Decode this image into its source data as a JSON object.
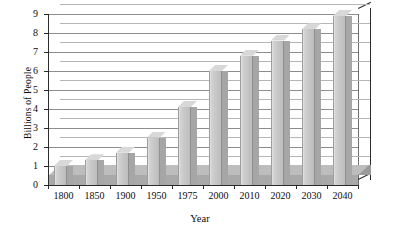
{
  "chart_data": {
    "type": "bar",
    "title": "",
    "subtitle": "",
    "xlabel": "Year",
    "ylabel": "Billions of People",
    "categories": [
      "1800",
      "1850",
      "1900",
      "1950",
      "1975",
      "2000",
      "2010",
      "2020",
      "2030",
      "2040"
    ],
    "values": [
      1.0,
      1.3,
      1.7,
      2.5,
      4.1,
      6.0,
      6.8,
      7.6,
      8.2,
      8.9
    ],
    "series": [
      {
        "name": "World Population",
        "values": [
          1.0,
          1.3,
          1.7,
          2.5,
          4.1,
          6.0,
          6.8,
          7.6,
          8.2,
          8.9
        ]
      }
    ],
    "ylim": [
      0,
      9
    ],
    "yticks": [
      0,
      1,
      2,
      3,
      4,
      5,
      6,
      7,
      8,
      9
    ],
    "ytick_labels": [
      "0",
      "1",
      "2",
      "3",
      "4",
      "5",
      "6",
      "7",
      "8",
      "9"
    ],
    "grid": true,
    "grid_axis": "y",
    "legend": false,
    "legend_position": "none",
    "style": "3d-column",
    "bar_color": "#c6c6c6",
    "bar_side_color": "#a6a6a6",
    "bar_top_color": "#d8d8d8",
    "floor_color": "#a9a9a9",
    "gridline_color": "#8d8d8d",
    "axis_color": "#2b2b2b",
    "background_color": "#ffffff",
    "annotations": []
  }
}
